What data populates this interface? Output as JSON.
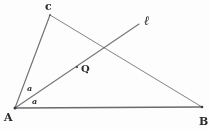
{
  "figure": {
    "kind": "hand-drawn-geometry-sketch",
    "background_color": "#fdfdfd",
    "stroke_color": "#55555a",
    "label_color": "#2b2b2b",
    "width": 210,
    "height": 129,
    "points": {
      "A": {
        "label": "A",
        "x": 15,
        "y": 108,
        "label_x": 4,
        "label_y": 112
      },
      "B": {
        "label": "B",
        "x": 202,
        "y": 107,
        "label_x": 199,
        "label_y": 116
      },
      "C": {
        "label": "c",
        "x": 50,
        "y": 15,
        "label_x": 45,
        "label_y": 1
      },
      "Q": {
        "label": "Q",
        "x": 77,
        "y": 67,
        "label_x": 81,
        "label_y": 64
      }
    },
    "segments": [
      {
        "name": "side-AB",
        "from": "A",
        "to": "B"
      },
      {
        "name": "side-AC",
        "from": "A",
        "to": "C"
      },
      {
        "name": "side-CB",
        "from": "C",
        "to": "B"
      }
    ],
    "ray": {
      "name": "ray-l",
      "label": "ℓ",
      "from_x": 15,
      "from_y": 108,
      "to_x": 139,
      "to_y": 24,
      "label_x": 144,
      "label_y": 14
    },
    "angles": [
      {
        "name": "angle-upper-at-A",
        "label": "a",
        "label_x": 27,
        "label_y": 84
      },
      {
        "name": "angle-lower-at-A",
        "label": "a",
        "label_x": 32,
        "label_y": 97
      }
    ]
  }
}
